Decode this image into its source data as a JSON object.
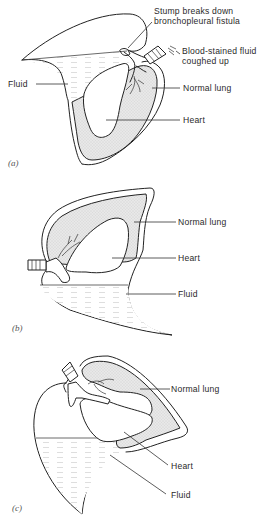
{
  "figure": {
    "panels": [
      {
        "id": "a",
        "panel_label": "(a)",
        "labels": {
          "stump_line1": "Stump breaks down",
          "stump_line2": "bronchopleural fistula",
          "blood_line1": "Blood-stained fluid",
          "blood_line2": "coughed up",
          "fluid": "Fluid",
          "normal_lung": "Normal lung",
          "heart": "Heart"
        }
      },
      {
        "id": "b",
        "panel_label": "(b)",
        "labels": {
          "normal_lung": "Normal lung",
          "heart": "Heart",
          "fluid": "Fluid"
        }
      },
      {
        "id": "c",
        "panel_label": "(c)",
        "labels": {
          "normal_lung": "Normal lung",
          "heart": "Heart",
          "fluid": "Fluid"
        }
      }
    ],
    "colors": {
      "line": "#222222",
      "lung_fill": "#e4e4e4",
      "background": "#ffffff"
    }
  }
}
